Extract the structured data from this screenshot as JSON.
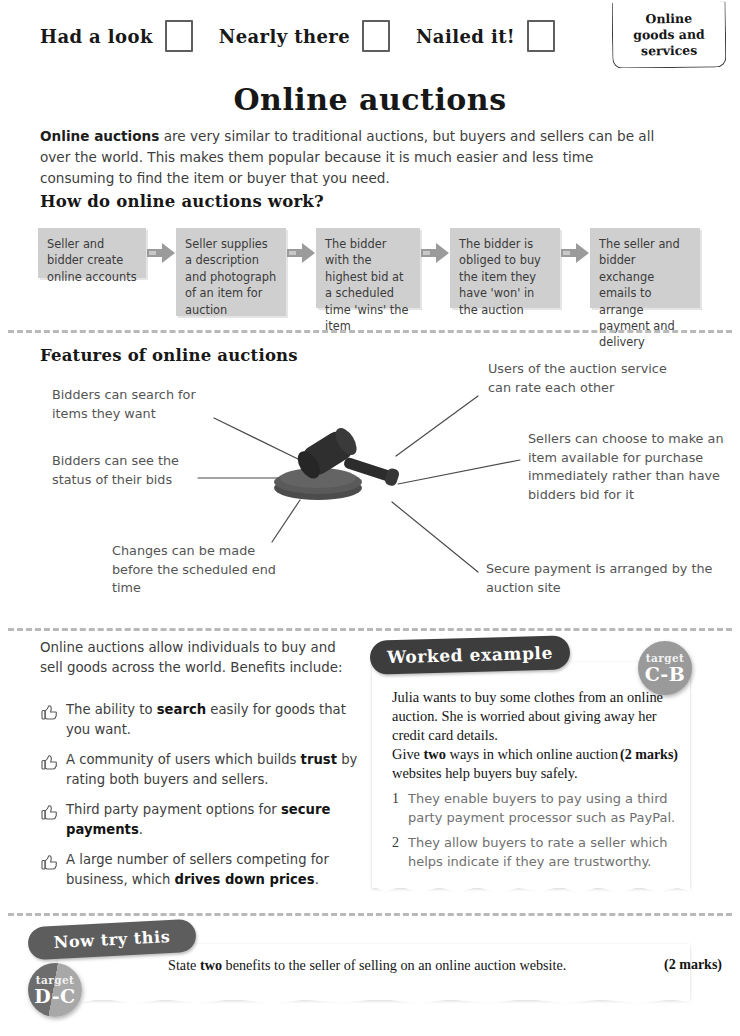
{
  "status_bar": {
    "items": [
      {
        "label": "Had a look",
        "checked": false
      },
      {
        "label": "Nearly there",
        "checked": false
      },
      {
        "label": "Nailed it!",
        "checked": false
      }
    ]
  },
  "unit_tab": {
    "line1": "Online",
    "line2": "goods and",
    "line3": "services"
  },
  "page_title": "Online auctions",
  "intro": {
    "lead": "Online auctions",
    "rest": " are very similar to traditional auctions, but buyers and sellers can be all over the world. This makes them popular because it is much easier and less time consuming to find the item or buyer that you need."
  },
  "how_section": {
    "heading": "How do online auctions work?",
    "steps": [
      "Seller and bidder create online accounts",
      "Seller supplies a description and photograph of an item for auction",
      "The bidder with the highest bid at a scheduled time 'wins' the item",
      "The bidder is obliged to buy the item they have 'won' in the auction",
      "The seller and bidder exchange emails to arrange payment and delivery"
    ]
  },
  "features_section": {
    "heading": "Features of online auctions",
    "center_icon": "gavel-icon",
    "labels": [
      "Bidders can search for items they want",
      "Bidders can see the status of their bids",
      "Changes can be made before the scheduled end time",
      "Users of the auction service can rate each other",
      "Sellers can choose to make an item available for purchase immediately rather than have bidders bid for it",
      "Secure payment is arranged by the auction site"
    ]
  },
  "benefits": {
    "intro": "Online auctions allow individuals to buy and sell goods across the world. Benefits include:",
    "items": [
      {
        "pre": "The ability to ",
        "bold": "search",
        "post": " easily for goods that you want."
      },
      {
        "pre": "A community of users which builds ",
        "bold": "trust",
        "post": " by rating both buyers and sellers."
      },
      {
        "pre": "Third party payment options for ",
        "bold": "secure payments",
        "post": "."
      },
      {
        "pre": "A large number of sellers competing for business, which ",
        "bold": "drives down prices",
        "post": "."
      }
    ]
  },
  "worked_example": {
    "tab_label": "Worked example",
    "target": {
      "word": "target",
      "grade": "C-B"
    },
    "scenario": "Julia wants to buy some clothes from an online auction. She is worried about giving away her credit card details.",
    "question_pre": "Give ",
    "question_bold": "two",
    "question_post": " ways in which online auction websites help buyers buy safely.",
    "marks": "(2 marks)",
    "answers": [
      {
        "num": "1",
        "text": "They enable buyers to pay using a third party payment processor such as PayPal."
      },
      {
        "num": "2",
        "text": "They allow buyers to rate a seller which helps indicate if they are trustworthy."
      }
    ]
  },
  "now_try_this": {
    "tab_label": "Now try this",
    "target": {
      "word": "target",
      "grade": "D-C"
    },
    "question_pre": "State ",
    "question_bold": "two",
    "question_post": " benefits to the seller of selling on an online auction website.",
    "marks": "(2 marks)"
  },
  "colors": {
    "flow_box": "#cfcfcf",
    "worked_tab": "#3d3d3d",
    "nowtry_tab": "#5d5d5d",
    "target_cb": "#9a9a9a",
    "gavel": "#3a3a3a",
    "handwriting": "#545454"
  }
}
